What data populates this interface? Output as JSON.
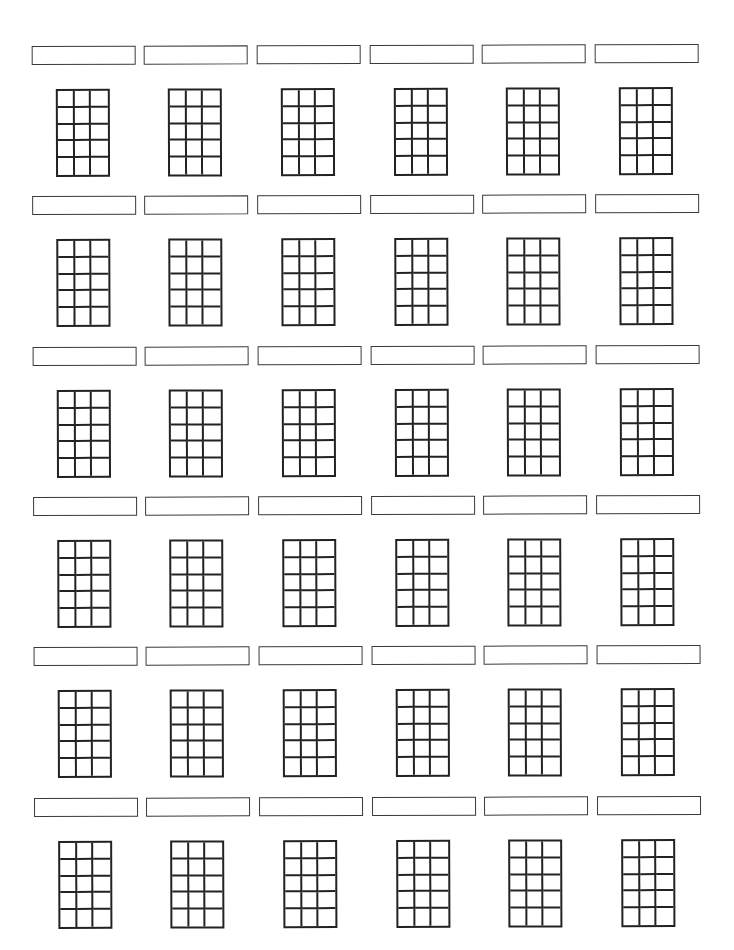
{
  "page": {
    "type": "blank chord chart worksheet",
    "background": "#ffffff",
    "line_color": "#222222"
  },
  "layout": {
    "rows": 6,
    "columns": 6,
    "row_tops": [
      45,
      195,
      346,
      496,
      646,
      797
    ],
    "column_lefts": [
      33,
      145,
      258,
      371,
      483,
      596
    ]
  },
  "chord_grid": {
    "strings": 4,
    "frets": 5,
    "cell_columns": 3,
    "cell_rows": 5
  },
  "charts": [
    {
      "name": "",
      "row": 0,
      "col": 0
    },
    {
      "name": "",
      "row": 0,
      "col": 1
    },
    {
      "name": "",
      "row": 0,
      "col": 2
    },
    {
      "name": "",
      "row": 0,
      "col": 3
    },
    {
      "name": "",
      "row": 0,
      "col": 4
    },
    {
      "name": "",
      "row": 0,
      "col": 5
    },
    {
      "name": "",
      "row": 1,
      "col": 0
    },
    {
      "name": "",
      "row": 1,
      "col": 1
    },
    {
      "name": "",
      "row": 1,
      "col": 2
    },
    {
      "name": "",
      "row": 1,
      "col": 3
    },
    {
      "name": "",
      "row": 1,
      "col": 4
    },
    {
      "name": "",
      "row": 1,
      "col": 5
    },
    {
      "name": "",
      "row": 2,
      "col": 0
    },
    {
      "name": "",
      "row": 2,
      "col": 1
    },
    {
      "name": "",
      "row": 2,
      "col": 2
    },
    {
      "name": "",
      "row": 2,
      "col": 3
    },
    {
      "name": "",
      "row": 2,
      "col": 4
    },
    {
      "name": "",
      "row": 2,
      "col": 5
    },
    {
      "name": "",
      "row": 3,
      "col": 0
    },
    {
      "name": "",
      "row": 3,
      "col": 1
    },
    {
      "name": "",
      "row": 3,
      "col": 2
    },
    {
      "name": "",
      "row": 3,
      "col": 3
    },
    {
      "name": "",
      "row": 3,
      "col": 4
    },
    {
      "name": "",
      "row": 3,
      "col": 5
    },
    {
      "name": "",
      "row": 4,
      "col": 0
    },
    {
      "name": "",
      "row": 4,
      "col": 1
    },
    {
      "name": "",
      "row": 4,
      "col": 2
    },
    {
      "name": "",
      "row": 4,
      "col": 3
    },
    {
      "name": "",
      "row": 4,
      "col": 4
    },
    {
      "name": "",
      "row": 4,
      "col": 5
    },
    {
      "name": "",
      "row": 5,
      "col": 0
    },
    {
      "name": "",
      "row": 5,
      "col": 1
    },
    {
      "name": "",
      "row": 5,
      "col": 2
    },
    {
      "name": "",
      "row": 5,
      "col": 3
    },
    {
      "name": "",
      "row": 5,
      "col": 4
    },
    {
      "name": "",
      "row": 5,
      "col": 5
    }
  ]
}
